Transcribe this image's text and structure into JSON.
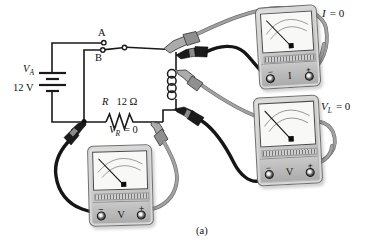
{
  "figure": {
    "caption": "(a)"
  },
  "colors": {
    "wire": "#1a1a1a",
    "cable_black": "#161616",
    "cable_gray": "#a2a2a2",
    "probe_gray": "#ababab",
    "meter_body": "#c9c9c9",
    "meter_face": "#f8f8f6"
  },
  "circuit": {
    "source_label": {
      "base": "V",
      "sub": "A"
    },
    "source_value": "12 V",
    "switch": {
      "contact_top": "A",
      "contact_bottom": "B"
    },
    "resistor": {
      "symbol": "R",
      "value": "12 Ω"
    },
    "resistor_reading": {
      "base": "V",
      "sub": "R",
      "eq": "= 0"
    }
  },
  "meters": {
    "ammeter": {
      "reading": {
        "base": "I",
        "eq": "= 0"
      },
      "unit": "I",
      "terminal_minus": "−",
      "terminal_plus": "+"
    },
    "vl": {
      "reading": {
        "base": "V",
        "sub": "L",
        "eq": "= 0"
      },
      "unit": "V",
      "terminal_minus": "−",
      "terminal_plus": "+"
    },
    "vr": {
      "unit": "V",
      "terminal_minus": "−",
      "terminal_plus": "+"
    }
  }
}
